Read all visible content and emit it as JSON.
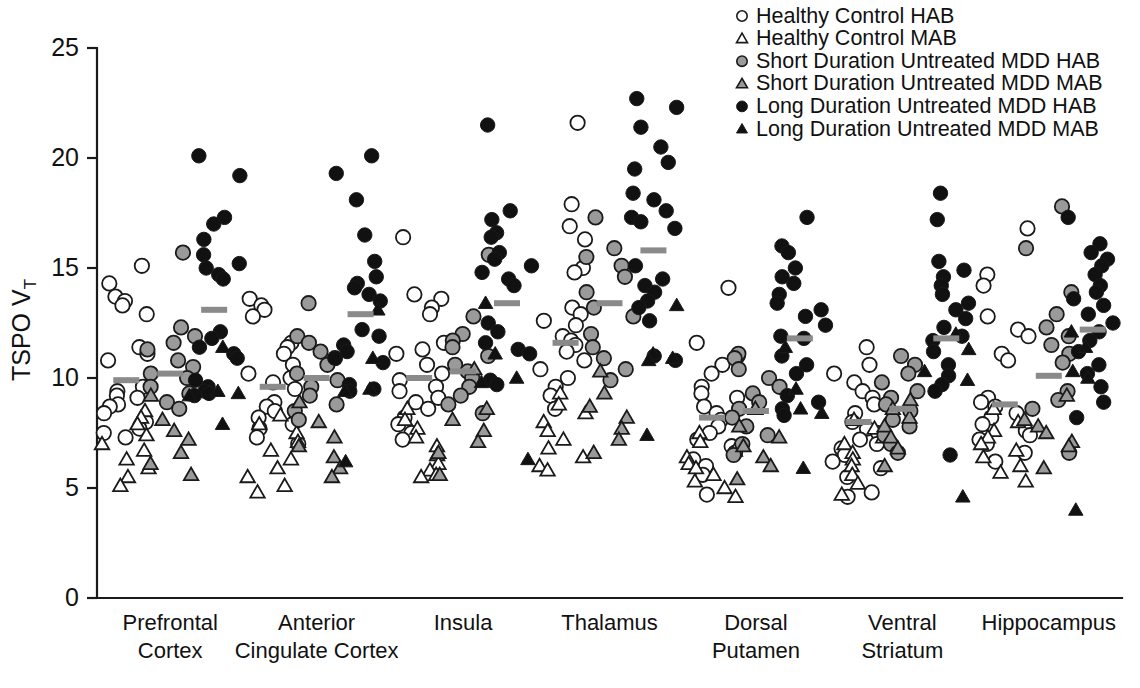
{
  "figure": {
    "title": "",
    "caption": ""
  },
  "axes": {
    "ylabel_main": "TSPO V",
    "ylabel_subscript": "T",
    "y_ticks": [
      0,
      5,
      10,
      15,
      20,
      25
    ],
    "ylim": [
      0,
      25
    ],
    "xlabel": "",
    "grid": false
  },
  "legend": {
    "position": "top-right",
    "items": [
      {
        "label": "Healthy Control HAB",
        "marker": "circle",
        "fill": "#ffffff",
        "stroke": "#1a1a1a",
        "group": "HC",
        "geno": "HAB"
      },
      {
        "label": "Healthy Control MAB",
        "marker": "triangle",
        "fill": "#ffffff",
        "stroke": "#1a1a1a",
        "group": "HC",
        "geno": "MAB"
      },
      {
        "label": "Short Duration Untreated MDD HAB",
        "marker": "circle",
        "fill": "#9a9a9a",
        "stroke": "#1a1a1a",
        "group": "SD",
        "geno": "HAB"
      },
      {
        "label": "Short Duration Untreated MDD MAB",
        "marker": "triangle",
        "fill": "#9a9a9a",
        "stroke": "#1a1a1a",
        "group": "SD",
        "geno": "MAB"
      },
      {
        "label": "Long Duration Untreated MDD HAB",
        "marker": "circle",
        "fill": "#111111",
        "stroke": "#111111",
        "group": "LD",
        "geno": "HAB"
      },
      {
        "label": "Long Duration Untreated MDD MAB",
        "marker": "triangle",
        "fill": "#111111",
        "stroke": "#111111",
        "group": "LD",
        "geno": "MAB"
      }
    ]
  },
  "chart_data": {
    "type": "scatter",
    "title": "",
    "xlabel": "",
    "ylabel": "TSPO VT",
    "ylim": [
      0,
      25
    ],
    "y_ticks": [
      0,
      5,
      10,
      15,
      20,
      25
    ],
    "grid": false,
    "legend_position": "top-right",
    "categories": [
      "Prefrontal Cortex",
      "Anterior Cingulate Cortex",
      "Insula",
      "Thalamus",
      "Dorsal Putamen",
      "Ventral Striatum",
      "Hippocampus"
    ],
    "category_labels": [
      [
        "Prefrontal",
        "Cortex"
      ],
      [
        "Anterior",
        "Cingulate Cortex"
      ],
      [
        "Insula",
        ""
      ],
      [
        "Thalamus",
        ""
      ],
      [
        "Dorsal",
        "Putamen"
      ],
      [
        "Ventral",
        "Striatum"
      ],
      [
        "Hippocampus",
        ""
      ]
    ],
    "subgroups": [
      "HC",
      "SD",
      "LD"
    ],
    "series": [
      {
        "name": "Healthy Control HAB",
        "group": "HC",
        "geno": "HAB",
        "marker": "circle",
        "fill": "#ffffff",
        "values_by_region": {
          "Prefrontal Cortex": [
            15.1,
            14.3,
            13.7,
            13.5,
            13.3,
            12.9,
            11.4,
            11.1,
            10.8,
            9.6,
            9.4,
            9.2,
            9.1,
            8.8,
            8.7,
            8.4,
            8.0,
            7.7,
            7.5,
            7.3
          ],
          "Anterior Cingulate Cortex": [
            13.6,
            13.3,
            13.1,
            12.8,
            11.6,
            11.4,
            11.1,
            10.6,
            10.2,
            10.0,
            9.8,
            9.5,
            8.9,
            8.7,
            8.5,
            8.2,
            7.9,
            7.7,
            7.3,
            7.0
          ],
          "Insula": [
            16.4,
            13.8,
            13.6,
            13.2,
            12.9,
            11.6,
            11.3,
            11.1,
            10.6,
            10.2,
            9.9,
            9.6,
            9.4,
            9.1,
            8.9,
            8.6,
            8.2,
            7.9,
            7.5,
            7.2
          ],
          "Thalamus": [
            21.6,
            17.9,
            16.9,
            16.3,
            15.0,
            14.8,
            13.2,
            12.9,
            12.6,
            12.4,
            11.9,
            11.7,
            11.5,
            11.2,
            10.8,
            10.4,
            10.0,
            9.6,
            9.2,
            8.6
          ],
          "Dorsal Putamen": [
            14.1,
            11.6,
            11.0,
            10.6,
            10.2,
            9.6,
            9.3,
            9.1,
            8.7,
            8.4,
            8.1,
            7.8,
            7.5,
            7.2,
            6.9,
            6.6,
            6.3,
            6.0,
            5.6,
            4.7
          ],
          "Ventral Striatum": [
            11.4,
            10.6,
            10.2,
            9.8,
            9.4,
            9.1,
            8.8,
            8.4,
            8.0,
            7.7,
            7.5,
            7.2,
            7.0,
            6.8,
            6.5,
            6.2,
            5.9,
            5.5,
            4.8,
            4.6
          ],
          "Hippocampus": [
            16.8,
            14.7,
            14.2,
            12.8,
            12.2,
            11.9,
            11.1,
            10.8,
            9.1,
            8.9,
            8.7,
            8.4,
            8.2,
            7.9,
            7.6,
            7.4,
            7.2,
            7.0,
            6.6,
            6.2
          ]
        }
      },
      {
        "name": "Healthy Control MAB",
        "group": "HC",
        "geno": "MAB",
        "marker": "triangle",
        "fill": "#ffffff",
        "values_by_region": {
          "Prefrontal Cortex": [
            8.5,
            8.2,
            7.9,
            7.4,
            7.0,
            6.7,
            6.3,
            5.9,
            5.5,
            5.1
          ],
          "Anterior Cingulate Cortex": [
            8.3,
            7.9,
            7.5,
            7.1,
            6.7,
            6.3,
            5.9,
            5.5,
            5.1,
            4.8
          ],
          "Insula": [
            8.6,
            8.1,
            7.7,
            7.3,
            6.9,
            6.5,
            6.1,
            5.8,
            5.6,
            5.5
          ],
          "Thalamus": [
            9.3,
            8.8,
            8.4,
            8.0,
            7.6,
            7.2,
            6.8,
            6.4,
            6.0,
            5.8
          ],
          "Dorsal Putamen": [
            7.5,
            7.1,
            6.7,
            6.4,
            6.1,
            5.9,
            5.6,
            5.3,
            5.0,
            4.6
          ],
          "Ventral Striatum": [
            8.1,
            7.7,
            7.3,
            7.0,
            6.6,
            6.3,
            6.0,
            5.6,
            5.2,
            4.7
          ],
          "Hippocampus": [
            8.6,
            8.0,
            7.6,
            7.3,
            7.0,
            6.7,
            6.4,
            6.0,
            5.7,
            5.3
          ]
        }
      },
      {
        "name": "Short Duration Untreated MDD HAB",
        "group": "SD",
        "geno": "HAB",
        "marker": "circle",
        "fill": "#9a9a9a",
        "values_by_region": {
          "Prefrontal Cortex": [
            15.7,
            12.3,
            11.9,
            11.6,
            11.3,
            10.8,
            10.5,
            10.2,
            10.0,
            9.6,
            9.3,
            8.9,
            8.6
          ],
          "Anterior Cingulate Cortex": [
            13.4,
            11.9,
            11.6,
            11.2,
            10.9,
            10.6,
            10.2,
            9.9,
            9.6,
            9.2,
            8.8,
            8.5,
            8.1
          ],
          "Insula": [
            15.6,
            12.8,
            12.0,
            11.7,
            11.4,
            11.0,
            10.6,
            10.3,
            10.0,
            9.6,
            9.2,
            8.8,
            8.4
          ],
          "Thalamus": [
            17.3,
            15.9,
            15.5,
            15.1,
            14.6,
            13.9,
            13.2,
            12.8,
            12.0,
            11.4,
            10.9,
            10.4,
            9.9
          ],
          "Dorsal Putamen": [
            11.1,
            10.9,
            10.4,
            10.0,
            9.6,
            9.3,
            8.9,
            8.6,
            8.2,
            7.8,
            7.4,
            7.0,
            6.5
          ],
          "Ventral Striatum": [
            11.0,
            10.6,
            10.2,
            9.8,
            9.4,
            9.1,
            8.8,
            8.5,
            8.1,
            7.8,
            7.4,
            7.0,
            6.6
          ],
          "Hippocampus": [
            17.8,
            15.9,
            13.9,
            12.9,
            12.3,
            11.9,
            11.5,
            11.1,
            10.7,
            9.4,
            9.0,
            8.6,
            6.6
          ]
        }
      },
      {
        "name": "Short Duration Untreated MDD MAB",
        "group": "SD",
        "geno": "MAB",
        "marker": "triangle",
        "fill": "#9a9a9a",
        "values_by_region": {
          "Prefrontal Cortex": [
            9.2,
            8.1,
            7.6,
            7.2,
            6.6,
            6.1,
            5.6
          ],
          "Anterior Cingulate Cortex": [
            8.9,
            8.0,
            7.3,
            6.9,
            6.4,
            5.9,
            5.5
          ],
          "Insula": [
            10.4,
            8.6,
            8.1,
            7.6,
            7.1,
            6.6,
            5.6
          ],
          "Thalamus": [
            10.3,
            9.3,
            8.7,
            8.2,
            7.7,
            7.2,
            6.6
          ],
          "Dorsal Putamen": [
            8.6,
            7.8,
            7.3,
            6.9,
            6.4,
            6.0,
            5.4
          ],
          "Ventral Striatum": [
            9.0,
            8.6,
            8.2,
            7.8,
            7.3,
            6.8,
            6.0
          ],
          "Hippocampus": [
            9.2,
            8.1,
            7.8,
            7.5,
            7.1,
            6.9,
            5.9
          ]
        }
      },
      {
        "name": "Long Duration Untreated MDD HAB",
        "group": "LD",
        "geno": "HAB",
        "marker": "circle",
        "fill": "#111111",
        "values_by_region": {
          "Prefrontal Cortex": [
            20.1,
            19.2,
            17.3,
            17.0,
            16.3,
            15.6,
            15.2,
            15.0,
            14.7,
            14.5,
            12.1,
            11.8,
            11.4,
            11.1,
            10.9,
            9.9,
            9.6,
            9.4,
            9.3,
            9.2
          ],
          "Anterior Cingulate Cortex": [
            20.1,
            19.3,
            18.1,
            16.5,
            15.3,
            14.6,
            14.3,
            14.1,
            13.8,
            13.5,
            12.2,
            11.9,
            11.5,
            11.2,
            10.9,
            10.7,
            9.7,
            9.5,
            9.4
          ],
          "Insula": [
            21.5,
            17.6,
            17.2,
            16.6,
            16.4,
            15.7,
            15.4,
            15.1,
            14.8,
            14.5,
            14.2,
            12.5,
            12.1,
            11.6,
            11.3,
            11.1,
            9.9,
            9.7
          ],
          "Thalamus": [
            22.7,
            22.3,
            21.4,
            20.5,
            19.8,
            19.5,
            18.4,
            18.1,
            17.6,
            17.3,
            17.1,
            16.8,
            15.1,
            14.5,
            14.2,
            13.9,
            13.5,
            13.2,
            12.6,
            11.0,
            10.8
          ],
          "Dorsal Putamen": [
            17.3,
            16.0,
            15.7,
            15.0,
            14.6,
            14.3,
            13.8,
            13.4,
            13.1,
            12.8,
            12.4,
            11.9,
            11.8,
            11.0,
            10.6,
            10.2,
            9.2,
            8.9,
            8.6,
            8.3
          ],
          "Ventral Striatum": [
            18.4,
            17.2,
            15.3,
            14.9,
            14.6,
            14.2,
            13.8,
            13.4,
            13.1,
            12.7,
            12.3,
            11.9,
            11.7,
            11.2,
            10.6,
            10.1,
            9.7,
            9.4,
            6.5
          ],
          "Hippocampus": [
            17.3,
            16.1,
            15.7,
            15.4,
            15.1,
            14.7,
            14.2,
            13.9,
            13.6,
            13.3,
            12.9,
            12.5,
            12.1,
            11.7,
            11.2,
            10.6,
            10.2,
            9.6,
            8.9,
            8.2
          ]
        }
      },
      {
        "name": "Long Duration Untreated MDD MAB",
        "group": "LD",
        "geno": "MAB",
        "marker": "triangle",
        "fill": "#111111",
        "values_by_region": {
          "Prefrontal Cortex": [
            11.4,
            9.4,
            9.3,
            9.2,
            7.9
          ],
          "Anterior Cingulate Cortex": [
            13.1,
            10.9,
            9.5,
            9.4,
            6.2
          ],
          "Insula": [
            13.4,
            11.1,
            10.0,
            9.8,
            6.3
          ],
          "Thalamus": [
            13.3,
            11.1,
            10.9,
            10.8,
            7.4
          ],
          "Dorsal Putamen": [
            11.4,
            9.5,
            8.6,
            8.4,
            5.9
          ],
          "Ventral Striatum": [
            12.0,
            11.3,
            10.3,
            9.9,
            4.6
          ],
          "Hippocampus": [
            12.1,
            11.4,
            10.3,
            10.0,
            4.0
          ]
        }
      }
    ],
    "means": {
      "Prefrontal Cortex": {
        "HC": 9.9,
        "SD": 10.2,
        "LD": 13.1
      },
      "Anterior Cingulate Cortex": {
        "HC": 9.6,
        "SD": 10.0,
        "LD": 12.9
      },
      "Insula": {
        "HC": 10.0,
        "SD": 10.3,
        "LD": 13.4
      },
      "Thalamus": {
        "HC": 11.6,
        "SD": 13.4,
        "LD": 15.8
      },
      "Dorsal Putamen": {
        "HC": 8.2,
        "SD": 8.5,
        "LD": 11.8
      },
      "Ventral Striatum": {
        "HC": 8.0,
        "SD": 8.6,
        "LD": 11.8
      },
      "Hippocampus": {
        "HC": 8.8,
        "SD": 10.1,
        "LD": 12.2
      }
    }
  }
}
